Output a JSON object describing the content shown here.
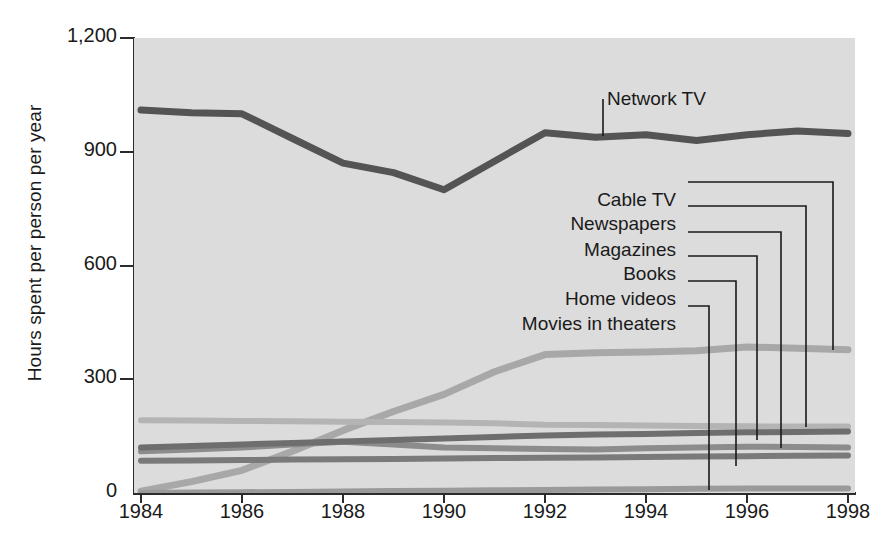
{
  "chart_data": {
    "type": "line",
    "title": "",
    "xlabel": "",
    "ylabel": "Hours spent per person per year",
    "xlim": [
      1984,
      1998
    ],
    "ylim": [
      0,
      1200
    ],
    "grid": false,
    "legend_position": "inline-annotations",
    "x_ticks": [
      "1984",
      "1986",
      "1988",
      "1990",
      "1992",
      "1994",
      "1996",
      "1998"
    ],
    "y_ticks": [
      "0",
      "300",
      "600",
      "900",
      "1,200"
    ],
    "x": [
      1984,
      1985,
      1986,
      1987,
      1988,
      1989,
      1990,
      1991,
      1992,
      1993,
      1994,
      1995,
      1996,
      1997,
      1998
    ],
    "series": [
      {
        "name": "Network TV",
        "color": "#545454",
        "width": 7,
        "values": [
          1010,
          1003,
          1000,
          935,
          870,
          845,
          800,
          875,
          950,
          938,
          945,
          930,
          945,
          955,
          948
        ]
      },
      {
        "name": "Cable TV",
        "color": "#a8a8a8",
        "width": 7,
        "values": [
          5,
          30,
          60,
          110,
          165,
          215,
          260,
          320,
          365,
          370,
          372,
          375,
          385,
          382,
          378
        ]
      },
      {
        "name": "Newspapers",
        "color": "#b4b4b4",
        "width": 6,
        "values": [
          192,
          191,
          190,
          189,
          188,
          187,
          186,
          184,
          180,
          179,
          178,
          177,
          176,
          175,
          175
        ]
      },
      {
        "name": "Magazines",
        "color": "#8c8c8c",
        "width": 6,
        "values": [
          110,
          115,
          120,
          128,
          135,
          128,
          120,
          118,
          116,
          115,
          118,
          120,
          122,
          121,
          120
        ]
      },
      {
        "name": "Books",
        "color": "#6e6e6e",
        "width": 6,
        "values": [
          120,
          124,
          128,
          132,
          136,
          140,
          144,
          148,
          152,
          154,
          156,
          158,
          160,
          161,
          162
        ]
      },
      {
        "name": "Home videos",
        "color": "#7a7a7a",
        "width": 6,
        "values": [
          85,
          86,
          87,
          88,
          89,
          90,
          91,
          92,
          93,
          94,
          95,
          96,
          97,
          98,
          99
        ]
      },
      {
        "name": "Movies in theaters",
        "color": "#9a9a9a",
        "width": 6,
        "values": [
          0,
          1,
          2,
          3,
          4,
          5,
          6,
          7,
          8,
          9,
          10,
          11,
          12,
          12,
          12
        ]
      }
    ],
    "annotations": [
      {
        "label": "Network TV",
        "label_x": 607,
        "label_y": 88,
        "anchor": "start",
        "leader": [
          [
            603,
            99
          ],
          [
            603,
            136
          ]
        ]
      },
      {
        "label": "Cable TV",
        "label_x": 676,
        "label_y": 189,
        "anchor": "end",
        "leader": [
          [
            688,
            182
          ],
          [
            833,
            182
          ],
          [
            833,
            350
          ]
        ]
      },
      {
        "label": "Newspapers",
        "label_x": 676,
        "label_y": 213,
        "anchor": "end",
        "leader": [
          [
            688,
            206
          ],
          [
            806,
            206
          ],
          [
            806,
            427
          ]
        ]
      },
      {
        "label": "Magazines",
        "label_x": 676,
        "label_y": 239,
        "anchor": "end",
        "leader": [
          [
            688,
            232
          ],
          [
            781,
            232
          ],
          [
            781,
            448
          ]
        ]
      },
      {
        "label": "Books",
        "label_x": 676,
        "label_y": 263,
        "anchor": "end",
        "leader": [
          [
            688,
            256
          ],
          [
            757,
            256
          ],
          [
            757,
            440
          ]
        ]
      },
      {
        "label": "Home videos",
        "label_x": 676,
        "label_y": 288,
        "anchor": "end",
        "leader": [
          [
            688,
            281
          ],
          [
            736,
            281
          ],
          [
            736,
            466
          ]
        ]
      },
      {
        "label": "Movies in theaters",
        "label_x": 676,
        "label_y": 313,
        "anchor": "end",
        "leader": [
          [
            688,
            306
          ],
          [
            709,
            306
          ],
          [
            709,
            490
          ]
        ]
      }
    ]
  }
}
